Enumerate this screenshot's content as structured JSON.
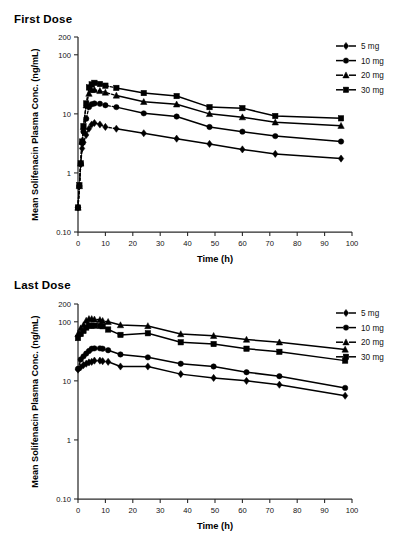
{
  "figure": {
    "axis_title_x": "Time (h)",
    "axis_title_y": "Mean Solifenacin Plasma Conc. (ng/mL)",
    "legend": [
      {
        "label": "5 mg",
        "marker": "diamond"
      },
      {
        "label": "10 mg",
        "marker": "circle"
      },
      {
        "label": "20 mg",
        "marker": "triangle"
      },
      {
        "label": "30 mg",
        "marker": "square"
      }
    ]
  },
  "panels": [
    {
      "id": "first",
      "title": "First Dose"
    },
    {
      "id": "last",
      "title": "Last Dose"
    }
  ],
  "chart_data": [
    {
      "type": "line",
      "title": "First Dose",
      "xlabel": "Time (h)",
      "ylabel": "Mean Solifenacin Plasma Conc. (ng/mL)",
      "yscale": "log",
      "ylim": [
        0.1,
        200
      ],
      "yticks": [
        0.1,
        1,
        10,
        100,
        200
      ],
      "ytick_labels": [
        "0.10",
        "1",
        "10",
        "100",
        "200"
      ],
      "xlim": [
        0,
        100
      ],
      "xticks": [
        0,
        10,
        20,
        30,
        40,
        50,
        60,
        70,
        80,
        90,
        100
      ],
      "grid": false,
      "legend_position": "top-right",
      "series": [
        {
          "name": "5 mg",
          "marker": "diamond",
          "x": [
            0,
            0.5,
            1,
            1.5,
            2,
            3,
            4,
            5,
            6,
            8,
            10,
            14,
            24,
            36,
            48,
            60,
            72,
            96
          ],
          "y": [
            0.26,
            0.6,
            1.4,
            2.6,
            3.3,
            4.4,
            5.6,
            6.6,
            7.0,
            6.6,
            6.0,
            5.6,
            4.7,
            3.8,
            3.1,
            2.5,
            2.1,
            1.75,
            1.25
          ]
        },
        {
          "name": "10 mg",
          "marker": "circle",
          "x": [
            0,
            0.5,
            1,
            1.5,
            2,
            3,
            4,
            5,
            6,
            8,
            10,
            14,
            24,
            36,
            48,
            60,
            72,
            96
          ],
          "y": [
            0.26,
            0.6,
            1.45,
            3.2,
            5.0,
            8.3,
            13.0,
            14.5,
            15.0,
            14.8,
            14.0,
            13.0,
            10.2,
            9.0,
            6.0,
            5.0,
            4.2,
            3.4,
            2.3
          ]
        },
        {
          "name": "20 mg",
          "marker": "triangle",
          "x": [
            0,
            0.5,
            1,
            1.5,
            2,
            3,
            4,
            5,
            6,
            8,
            10,
            14,
            24,
            36,
            48,
            60,
            72,
            96
          ],
          "y": [
            0.26,
            0.6,
            1.45,
            3.4,
            6.0,
            14.0,
            22.0,
            25.5,
            25.5,
            24.5,
            23.0,
            20.5,
            16.0,
            14.5,
            10.0,
            8.8,
            7.2,
            6.3,
            4.4
          ]
        },
        {
          "name": "30 mg",
          "marker": "square",
          "x": [
            0,
            0.5,
            1,
            1.5,
            2,
            3,
            4,
            5,
            6,
            8,
            10,
            14,
            24,
            36,
            48,
            60,
            72,
            96
          ],
          "y": [
            0.26,
            0.62,
            1.45,
            3.4,
            6.2,
            15.0,
            28.0,
            31.5,
            33.5,
            32.0,
            30.0,
            27.5,
            22.5,
            20.0,
            13.0,
            12.5,
            9.2,
            8.4,
            5.4
          ]
        }
      ]
    },
    {
      "type": "line",
      "title": "Last Dose",
      "xlabel": "Time (h)",
      "ylabel": "Mean Solifenacin Plasma Conc. (ng/mL)",
      "yscale": "log",
      "ylim": [
        0.1,
        200
      ],
      "yticks": [
        0.1,
        1,
        10,
        100,
        200
      ],
      "ytick_labels": [
        "0.10",
        "1",
        "10",
        "100",
        "200"
      ],
      "xlim": [
        0,
        100
      ],
      "xticks": [
        0,
        10,
        20,
        30,
        40,
        50,
        60,
        70,
        80,
        90,
        100
      ],
      "grid": false,
      "legend_position": "top-right",
      "series": [
        {
          "name": "5 mg",
          "marker": "diamond",
          "x": [
            0,
            1,
            2,
            3,
            4,
            5,
            6,
            8,
            9,
            11,
            15.5,
            25.5,
            37.5,
            49.5,
            61.5,
            73.5,
            97.5
          ],
          "y": [
            15.5,
            17.0,
            18.5,
            19.5,
            20.5,
            21.0,
            22.0,
            22.0,
            21.5,
            21.0,
            17.5,
            17.5,
            13.0,
            11.2,
            10.0,
            8.6,
            5.6
          ]
        },
        {
          "name": "10 mg",
          "marker": "circle",
          "x": [
            0,
            1,
            2,
            3,
            4,
            5,
            6,
            8,
            9,
            11,
            15.5,
            25.5,
            37.5,
            49.5,
            61.5,
            73.5,
            97.5
          ],
          "y": [
            16.0,
            23.0,
            26.0,
            29.0,
            32.0,
            35.0,
            35.5,
            35.5,
            35.0,
            33.0,
            28.0,
            25.0,
            19.5,
            17.5,
            14.0,
            12.0,
            7.6
          ]
        },
        {
          "name": "20 mg",
          "marker": "triangle",
          "x": [
            0,
            1,
            2,
            3,
            4,
            5,
            6,
            8,
            9,
            11,
            15.5,
            25.5,
            37.5,
            49.5,
            61.5,
            73.5,
            97.5
          ],
          "y": [
            62.0,
            78.0,
            88.0,
            105.0,
            112.0,
            112.0,
            110.0,
            108.0,
            104.0,
            100.0,
            88.0,
            85.0,
            62.0,
            58.0,
            50.0,
            45.0,
            34.0
          ]
        },
        {
          "name": "30 mg",
          "marker": "square",
          "x": [
            0,
            1,
            2,
            3,
            4,
            5,
            6,
            8,
            9,
            11,
            15.5,
            25.5,
            37.5,
            49.5,
            61.5,
            73.5,
            97.5
          ],
          "y": [
            53.0,
            62.0,
            70.0,
            80.0,
            86.0,
            86.0,
            86.0,
            85.0,
            84.0,
            74.0,
            60.0,
            64.0,
            45.0,
            42.0,
            35.0,
            31.0,
            22.0
          ]
        }
      ]
    }
  ]
}
